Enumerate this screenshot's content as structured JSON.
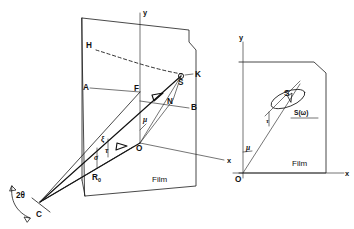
{
  "figure": {
    "background_color": "#ffffff",
    "line_color": "#1a1a1a",
    "panels": [
      {
        "id": "left-panel",
        "name": "perspective-view",
        "film_label": "Film",
        "axes": [
          {
            "name": "y-axis",
            "label": "y"
          },
          {
            "name": "x-axis",
            "label": "x"
          }
        ],
        "points": [
          {
            "name": "point-H",
            "label": "H"
          },
          {
            "name": "point-A",
            "label": "A"
          },
          {
            "name": "point-F",
            "label": "F"
          },
          {
            "name": "point-K",
            "label": "K"
          },
          {
            "name": "point-S",
            "label": "S"
          },
          {
            "name": "point-B",
            "label": "B"
          },
          {
            "name": "point-N",
            "label": "N"
          },
          {
            "name": "point-O",
            "label": "O"
          },
          {
            "name": "point-C",
            "label": "C"
          }
        ],
        "annotations": [
          {
            "name": "angle-two-theta",
            "label": "2θ"
          },
          {
            "name": "radius-r-zero",
            "label": "R",
            "subscript": "0"
          },
          {
            "name": "angle-mu",
            "label": "μ"
          },
          {
            "name": "length-xi",
            "label": "ξ"
          },
          {
            "name": "angle-sigma",
            "label": "σ"
          },
          {
            "name": "angle-tau",
            "label": "τ"
          }
        ]
      },
      {
        "id": "right-panel",
        "name": "film-plane-view",
        "film_label": "Film",
        "axes": [
          {
            "name": "y-axis",
            "label": "y"
          },
          {
            "name": "x-axis",
            "label": "x"
          }
        ],
        "points": [
          {
            "name": "point-O",
            "label": "O"
          },
          {
            "name": "point-S",
            "label": "S"
          }
        ],
        "annotations": [
          {
            "name": "spot-trace-label",
            "label": "S(ω)"
          },
          {
            "name": "angle-mu",
            "label": "μ"
          },
          {
            "name": "angle-tau",
            "label": "τ"
          }
        ]
      }
    ]
  }
}
